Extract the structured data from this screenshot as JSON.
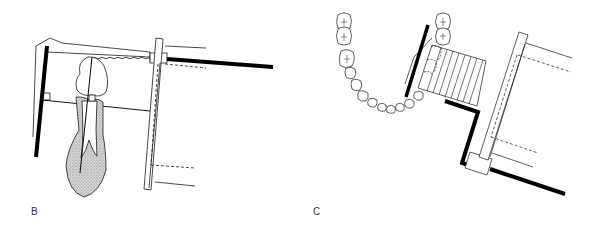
{
  "figure": {
    "panels": [
      {
        "id": "B",
        "label": "B",
        "description": "Film holder with tooth in long-axis alignment (lateral view)"
      },
      {
        "id": "C",
        "label": "C",
        "description": "Film holder and bite block positioned on dental arch (occlusal view)"
      }
    ]
  },
  "colors": {
    "background": "#ffffff",
    "line": "#1a1a1a",
    "root_fill": "#c8c8c8",
    "label": "#333333"
  }
}
